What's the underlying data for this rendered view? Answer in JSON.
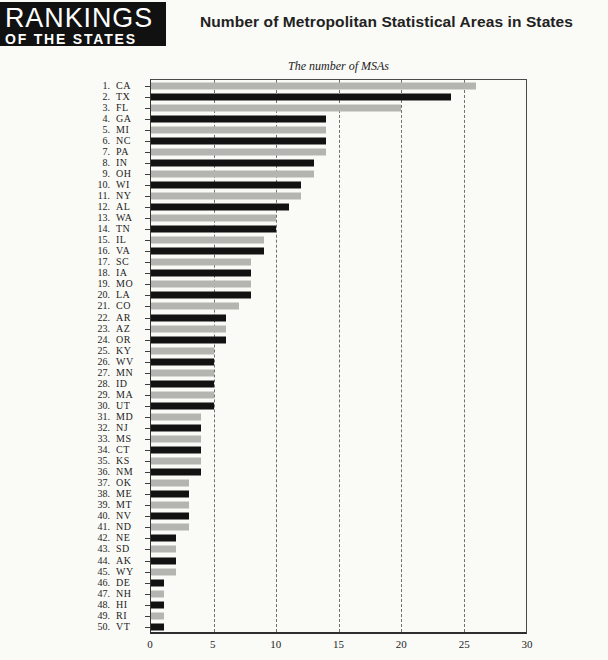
{
  "logo": {
    "line1": "RANKINGS",
    "line2": "OF THE STATES",
    "background": "#111111",
    "foreground": "#ffffff"
  },
  "header": {
    "title": "Number of Metropolitan Statistical Areas in States"
  },
  "chart_data": {
    "type": "bar",
    "orientation": "horizontal",
    "subtitle": "The number of MSAs",
    "xlabel": "",
    "ylabel": "",
    "xlim": [
      0,
      30
    ],
    "x_ticks": [
      0,
      5,
      10,
      15,
      20,
      25,
      30
    ],
    "gridlines_at": [
      5,
      10,
      15,
      20,
      25
    ],
    "grid_style": "dashed-vertical",
    "legend": "none",
    "colors": {
      "odd_rank_bar": "#b4b4b1",
      "even_rank_bar": "#121212",
      "frame": "#4a4a4a",
      "text": "#1d1d1d"
    },
    "states": [
      {
        "rank": 1,
        "abbr": "CA",
        "value": 26
      },
      {
        "rank": 2,
        "abbr": "TX",
        "value": 24
      },
      {
        "rank": 3,
        "abbr": "FL",
        "value": 20
      },
      {
        "rank": 4,
        "abbr": "GA",
        "value": 14
      },
      {
        "rank": 5,
        "abbr": "MI",
        "value": 14
      },
      {
        "rank": 6,
        "abbr": "NC",
        "value": 14
      },
      {
        "rank": 7,
        "abbr": "PA",
        "value": 14
      },
      {
        "rank": 8,
        "abbr": "IN",
        "value": 13
      },
      {
        "rank": 9,
        "abbr": "OH",
        "value": 13
      },
      {
        "rank": 10,
        "abbr": "WI",
        "value": 12
      },
      {
        "rank": 11,
        "abbr": "NY",
        "value": 12
      },
      {
        "rank": 12,
        "abbr": "AL",
        "value": 11
      },
      {
        "rank": 13,
        "abbr": "WA",
        "value": 10
      },
      {
        "rank": 14,
        "abbr": "TN",
        "value": 10
      },
      {
        "rank": 15,
        "abbr": "IL",
        "value": 9
      },
      {
        "rank": 16,
        "abbr": "VA",
        "value": 9
      },
      {
        "rank": 17,
        "abbr": "SC",
        "value": 8
      },
      {
        "rank": 18,
        "abbr": "IA",
        "value": 8
      },
      {
        "rank": 19,
        "abbr": "MO",
        "value": 8
      },
      {
        "rank": 20,
        "abbr": "LA",
        "value": 8
      },
      {
        "rank": 21,
        "abbr": "CO",
        "value": 7
      },
      {
        "rank": 22,
        "abbr": "AR",
        "value": 6
      },
      {
        "rank": 23,
        "abbr": "AZ",
        "value": 6
      },
      {
        "rank": 24,
        "abbr": "OR",
        "value": 6
      },
      {
        "rank": 25,
        "abbr": "KY",
        "value": 5
      },
      {
        "rank": 26,
        "abbr": "WV",
        "value": 5
      },
      {
        "rank": 27,
        "abbr": "MN",
        "value": 5
      },
      {
        "rank": 28,
        "abbr": "ID",
        "value": 5
      },
      {
        "rank": 29,
        "abbr": "MA",
        "value": 5
      },
      {
        "rank": 30,
        "abbr": "UT",
        "value": 5
      },
      {
        "rank": 31,
        "abbr": "MD",
        "value": 4
      },
      {
        "rank": 32,
        "abbr": "NJ",
        "value": 4
      },
      {
        "rank": 33,
        "abbr": "MS",
        "value": 4
      },
      {
        "rank": 34,
        "abbr": "CT",
        "value": 4
      },
      {
        "rank": 35,
        "abbr": "KS",
        "value": 4
      },
      {
        "rank": 36,
        "abbr": "NM",
        "value": 4
      },
      {
        "rank": 37,
        "abbr": "OK",
        "value": 3
      },
      {
        "rank": 38,
        "abbr": "ME",
        "value": 3
      },
      {
        "rank": 39,
        "abbr": "MT",
        "value": 3
      },
      {
        "rank": 40,
        "abbr": "NV",
        "value": 3
      },
      {
        "rank": 41,
        "abbr": "ND",
        "value": 3
      },
      {
        "rank": 42,
        "abbr": "NE",
        "value": 2
      },
      {
        "rank": 43,
        "abbr": "SD",
        "value": 2
      },
      {
        "rank": 44,
        "abbr": "AK",
        "value": 2
      },
      {
        "rank": 45,
        "abbr": "WY",
        "value": 2
      },
      {
        "rank": 46,
        "abbr": "DE",
        "value": 1
      },
      {
        "rank": 47,
        "abbr": "NH",
        "value": 1
      },
      {
        "rank": 48,
        "abbr": "HI",
        "value": 1
      },
      {
        "rank": 49,
        "abbr": "RI",
        "value": 1
      },
      {
        "rank": 50,
        "abbr": "VT",
        "value": 1
      }
    ]
  }
}
